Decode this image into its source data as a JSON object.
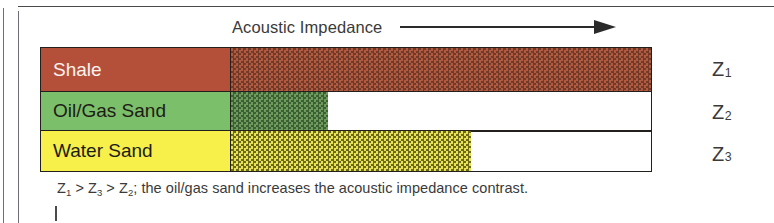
{
  "diagram": {
    "axis_title": "Acoustic Impedance",
    "arrow_direction": "right",
    "rows": [
      {
        "label": "Shale",
        "z_label": "Z",
        "z_subscript": "1",
        "solid_color": "#b4503a",
        "texture_color": "#733a29",
        "bar_length_px": 421
      },
      {
        "label": "Oil/Gas Sand",
        "z_label": "Z",
        "z_subscript": "2",
        "solid_color": "#7cbf6a",
        "texture_color": "#3d5f34",
        "bar_length_px": 98
      },
      {
        "label": "Water Sand",
        "z_label": "Z",
        "z_subscript": "3",
        "solid_color": "#f7ef4a",
        "texture_color": "#6e6a1c",
        "bar_length_px": 241
      }
    ],
    "caption": {
      "z_a": "Z",
      "z_a_sub": "1",
      "op_1": " > ",
      "z_b": "Z",
      "z_b_sub": "3",
      "op_2": " > ",
      "z_c": "Z",
      "z_c_sub": "2",
      "tail": "; the oil/gas sand increases the acoustic impedance contrast."
    }
  }
}
